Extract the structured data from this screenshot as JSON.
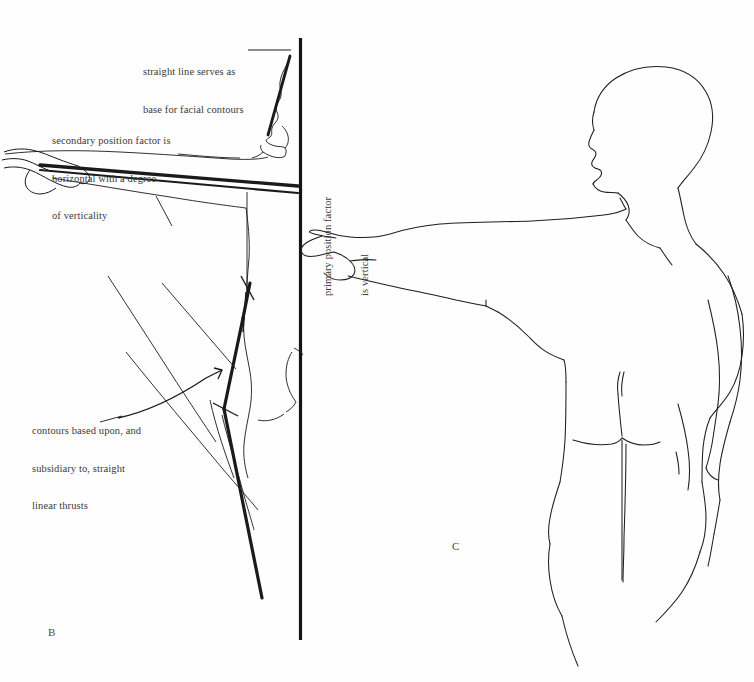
{
  "page": {
    "background_color": "#fefefe",
    "ink_color": "#1a1a1a",
    "text_color": "#3a3a3a",
    "width": 754,
    "height": 682
  },
  "annotations": {
    "straight_line": {
      "name": "straight-line-note",
      "lines": [
        "straight line serves as",
        "base for facial contours"
      ]
    },
    "secondary": {
      "name": "secondary-position-note",
      "lines": [
        "secondary position factor is",
        "horizontal with a degree",
        "of verticality"
      ]
    },
    "contours": {
      "name": "contours-note",
      "lines": [
        "contours based upon, and",
        "subsidiary to, straight",
        "linear thrusts"
      ]
    },
    "primary": {
      "name": "primary-position-note",
      "lines": [
        "primary position factor",
        "is vertical"
      ]
    }
  },
  "figures": {
    "b": {
      "label": "B",
      "caption": "analytical line construction of figure with outstretched arm"
    },
    "c": {
      "label": "C",
      "caption": "contour line drawing of standing figure, rear view, arm extended"
    }
  },
  "icons": {
    "arrow_head": "arrow-up-right-icon",
    "plumb_line": "vertical-axis-line"
  }
}
